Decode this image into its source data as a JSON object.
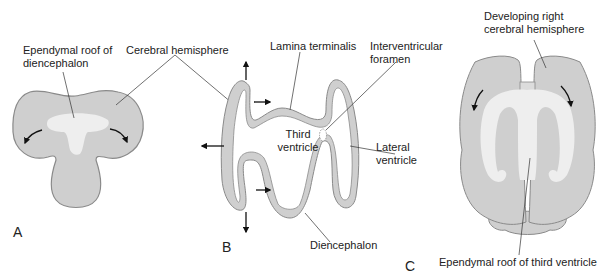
{
  "figure": {
    "panels": [
      {
        "id": "A",
        "letter": "A",
        "labels": {
          "ependymal_roof_line1": "Ependymal roof of",
          "ependymal_roof_line2": "diencephalon",
          "cerebral_hemisphere": "Cerebral hemisphere"
        }
      },
      {
        "id": "B",
        "letter": "B",
        "labels": {
          "lamina_terminalis": "Lamina terminalis",
          "interventricular_line1": "Interventricular",
          "interventricular_line2": "foramen",
          "third_ventricle_line1": "Third",
          "third_ventricle_line2": "ventricle",
          "lateral_ventricle_line1": "Lateral",
          "lateral_ventricle_line2": "ventricle",
          "diencephalon": "Diencephalon"
        }
      },
      {
        "id": "C",
        "letter": "C",
        "labels": {
          "developing_line1": "Developing right",
          "developing_line2": "cerebral hemisphere",
          "ependymal_roof_third": "Ependymal roof of third ventricle"
        }
      }
    ],
    "colors": {
      "tissue_fill": "#cfcfcf",
      "tissue_stroke": "#8a8a8a",
      "ependyma_fill": "#eeeeee",
      "leader_line": "#333333",
      "arrow": "#111111",
      "text": "#222222"
    }
  }
}
